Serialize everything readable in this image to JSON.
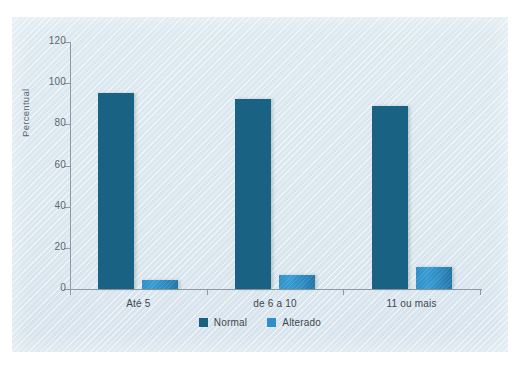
{
  "caption_fragment": "",
  "chart_data": {
    "type": "bar",
    "title": "",
    "xlabel": "",
    "ylabel": "Percentual",
    "categories": [
      "Até 5",
      "de 6 a 10",
      "11 ou mais"
    ],
    "series": [
      {
        "name": "Normal",
        "color": "#1a5f7e",
        "values": [
          95,
          92.5,
          89
        ]
      },
      {
        "name": "Alterado",
        "color": "#2f8fc6",
        "values": [
          4.5,
          7,
          10.5
        ]
      }
    ],
    "ylim": [
      0,
      120
    ],
    "yticks": [
      0,
      20,
      40,
      60,
      80,
      100,
      120
    ],
    "ytick_labels": [
      "0",
      "20",
      "40",
      "60",
      "80",
      "100",
      "120"
    ],
    "grid": false,
    "legend_position": "bottom",
    "background_color": "#dce8ef",
    "axis_color": "#8b9aa5"
  }
}
